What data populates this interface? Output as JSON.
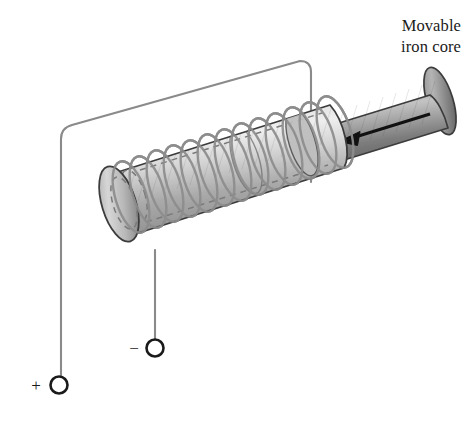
{
  "figure": {
    "background_color": "#ffffff"
  },
  "annotations": {
    "core_label": {
      "line1": "Movable",
      "line2": "iron core",
      "align": "right",
      "color": "#1a1a1a"
    }
  },
  "terminals": [
    {
      "id": "positive",
      "sign": "+",
      "cx": 59,
      "cy": 385,
      "r": 8.5,
      "stroke": "#1a1a1a"
    },
    {
      "id": "negative",
      "sign": "−",
      "cx": 155,
      "cy": 348,
      "r": 8.5,
      "stroke": "#1a1a1a"
    }
  ],
  "arrow": {
    "id": "motion-arrow",
    "direction": "left",
    "color": "#111111",
    "x1": 430,
    "y1": 114,
    "x2": 342,
    "y2": 141
  },
  "colors": {
    "wire": "#8a8a8a",
    "coil": "#8d8d8d",
    "core_light": "#e4e4e4",
    "core_dark": "#6e6e6e",
    "solenoid_light": "#f0f0f0",
    "solenoid_dark": "#9a9a9a",
    "outline": "#3c3c3c",
    "hidden_edge": "#7a7a7a",
    "terminal_stroke": "#1a1a1a"
  },
  "geometry": {
    "coil_turns": 13,
    "solenoid_axis_angle_deg": -17,
    "core_visible_length_px": 150
  }
}
